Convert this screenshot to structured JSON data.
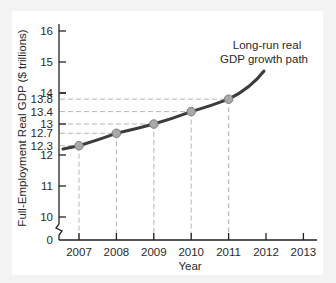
{
  "chart_data": {
    "type": "line",
    "title": "",
    "xlabel": "Year",
    "ylabel": "Full-Employment Real GDP ($ trillions)",
    "x_ticks": [
      "2007",
      "2008",
      "2009",
      "2010",
      "2011",
      "2012",
      "2013"
    ],
    "y_ticks": [
      "0",
      "10",
      "11",
      "12",
      "12.3",
      "12.7",
      "13",
      "13.4",
      "13.8",
      "14",
      "15",
      "16"
    ],
    "y_axis_break": true,
    "ylim": [
      0,
      16.4
    ],
    "grid": false,
    "legend": null,
    "series": [
      {
        "name": "Long-run real GDP growth path",
        "x": [
          2007,
          2008,
          2009,
          2010,
          2011
        ],
        "values": [
          12.3,
          12.7,
          13.0,
          13.4,
          13.8
        ]
      }
    ],
    "annotations": [
      {
        "text": "Long-run real GDP growth path",
        "lines": [
          "Long-run real",
          "GDP growth path"
        ]
      }
    ],
    "reference_lines": "dashed guides from each point to the x and y axes",
    "colors": {
      "curve": "#3a3a3a",
      "points": "#a9a9a9",
      "dashes": "#b5b5b5"
    }
  }
}
